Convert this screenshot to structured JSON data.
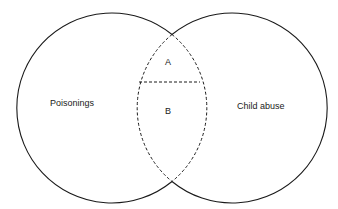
{
  "diagram": {
    "type": "venn",
    "sets": [
      {
        "label": "Poisonings"
      },
      {
        "label": "Child abuse"
      }
    ],
    "intersection_regions": [
      {
        "label": "A"
      },
      {
        "label": "B"
      }
    ],
    "colors": {
      "stroke": "#1a1a1a",
      "background": "#ffffff"
    }
  }
}
